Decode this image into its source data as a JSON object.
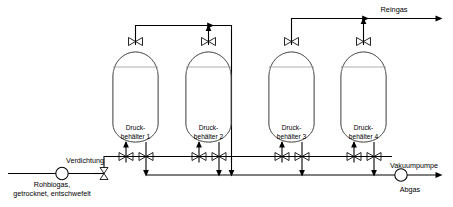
{
  "diagram": {
    "type": "process-flow-diagram"
  },
  "flow_labels": {
    "product_gas": "Reingas",
    "compression": "Verdichtung",
    "feed_line1": "Rohbiogas,",
    "feed_line2": "getrocknet, entschwefelt",
    "vacuum_pump": "Vakuumpumpe",
    "off_gas": "Abgas"
  },
  "vessels": [
    {
      "line1": "Druck-",
      "line2": "behälter 1"
    },
    {
      "line1": "Druck-",
      "line2": "behälter 2"
    },
    {
      "line1": "Druck-",
      "line2": "behälter 3"
    },
    {
      "line1": "Druck-",
      "line2": "behälter 4"
    }
  ],
  "equipment": {
    "compressor_symbol": "circle",
    "vacuum_pump_symbol": "circle",
    "valve_symbol": "bowtie",
    "adsorbent_fill": "hatched"
  },
  "colors": {
    "line": "#000000",
    "vessel_outline": "#555555",
    "adsorbent_fill": "#cfcfcf",
    "background": "#ffffff",
    "text": "#000000"
  }
}
